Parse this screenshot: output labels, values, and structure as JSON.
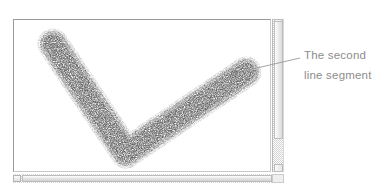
{
  "figure": {
    "background_color": "#ffffff",
    "width": 392,
    "height": 191
  },
  "app_window": {
    "name": "drawing-canvas-window",
    "canvas_background": "#ffffff",
    "border_color": "#9a9a9a"
  },
  "canvas": {
    "artwork": {
      "name": "checkmark-brush-stroke",
      "description": "Two-segment checkmark drawn with a grainy airbrush",
      "stroke_color": "#4a4a4a",
      "stroke_width_px": 26,
      "texture": "speckled airbrush grain",
      "segments": [
        {
          "name": "first-line-segment",
          "from": {
            "x": 39,
            "y": 24
          },
          "to": {
            "x": 112,
            "y": 133
          }
        },
        {
          "name": "second-line-segment",
          "from": {
            "x": 112,
            "y": 133
          },
          "to": {
            "x": 232,
            "y": 52
          }
        }
      ]
    }
  },
  "scrollbars": {
    "vertical": {
      "name": "vertical-scrollbar",
      "thumb_position_percent": 0,
      "thumb_size_percent": 77
    },
    "horizontal": {
      "name": "horizontal-scrollbar",
      "thumb_position_percent": 0,
      "thumb_size_percent": 92
    }
  },
  "annotation": {
    "name": "second-segment-callout",
    "lines": [
      "The second",
      "line segment"
    ],
    "text_color": "#8d8d8d",
    "leader_line": {
      "color": "#9a9a9a",
      "from": {
        "x": 244,
        "y": 71
      },
      "to": {
        "x": 300,
        "y": 58
      }
    }
  }
}
